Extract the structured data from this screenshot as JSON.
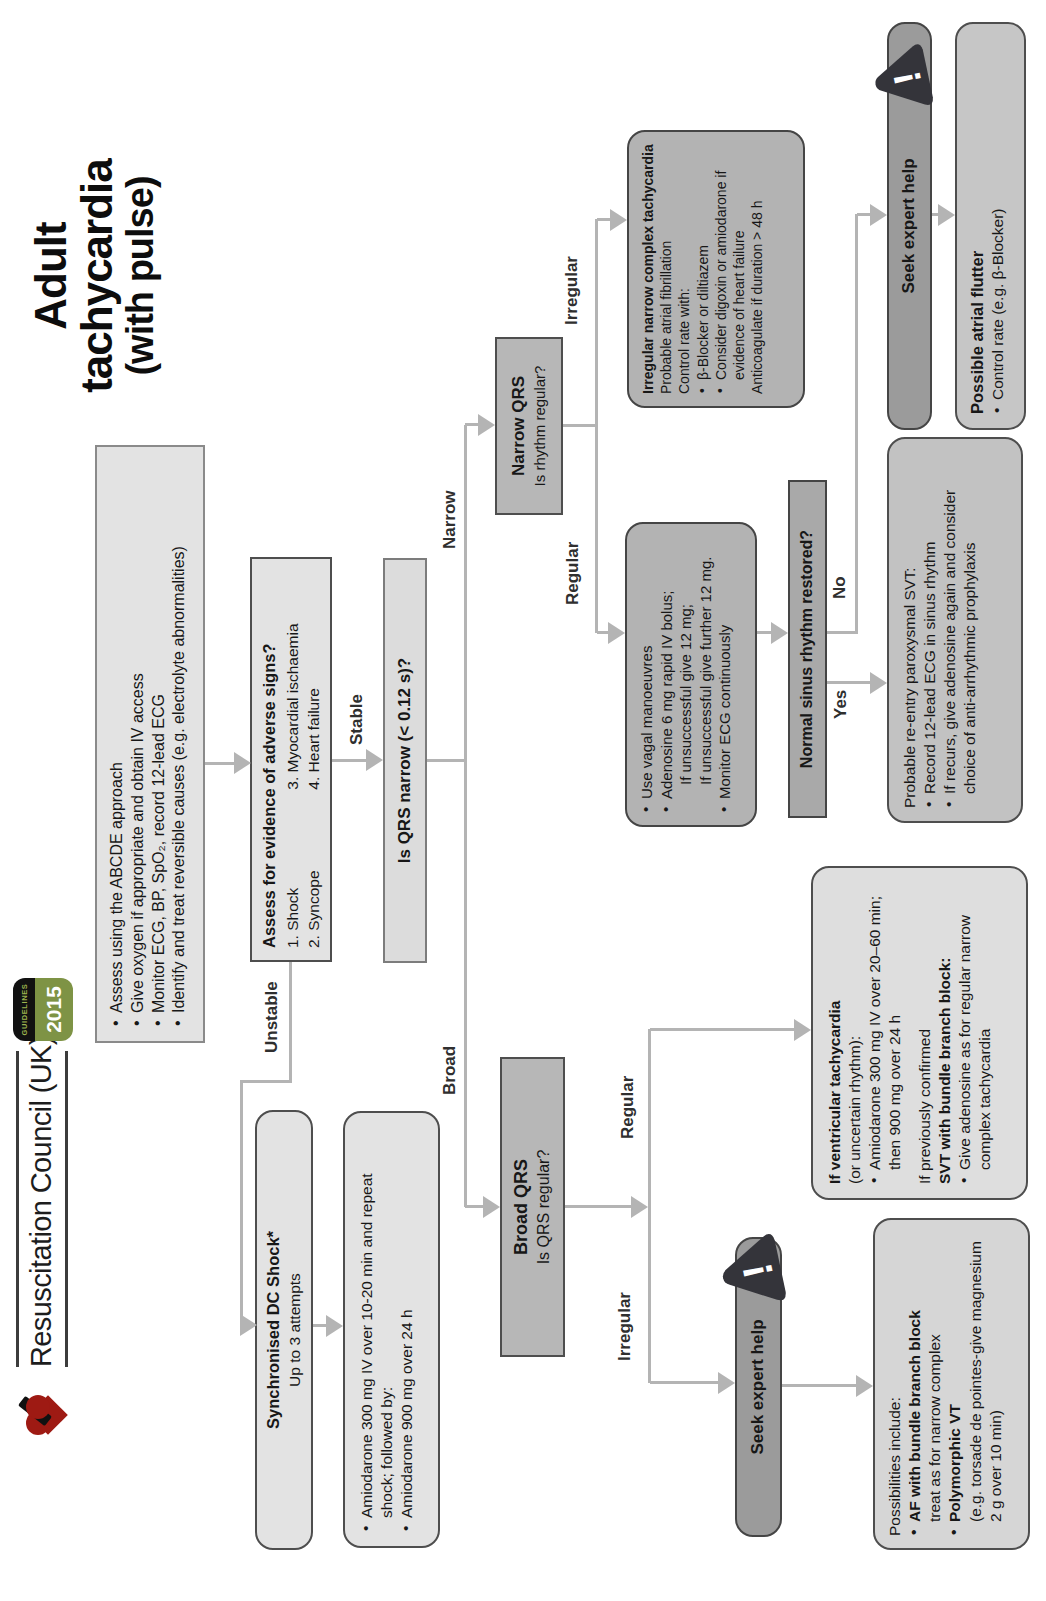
{
  "header": {
    "org_name": "Resuscitation Council (UK)",
    "badge_top": "GUIDELINES",
    "badge_year": "2015",
    "title_line1": "Adult tachycardia",
    "title_line2": "(with pulse)"
  },
  "colors": {
    "accent_green": "#7e9345",
    "heart_red": "#9e1a13",
    "box_light": "#e3e3e3",
    "box_mid": "#b7b7b7",
    "box_dark": "#9b9b9b",
    "connector_gray": "#b4b4b4",
    "warning_icon_dark": "#34343a"
  },
  "icons": {
    "warning": "!"
  },
  "labels": {
    "unstable": "Unstable",
    "stable": "Stable",
    "broad": "Broad",
    "narrow": "Narrow",
    "regular": "Regular",
    "irregular": "Irregular",
    "yes": "Yes",
    "no": "No"
  },
  "assess_box": {
    "items": [
      "Assess using the ABCDE approach",
      "Give oxygen if appropriate and obtain IV access",
      "Monitor ECG, BP, SpO₂, record 12-lead ECG",
      "Identify and treat reversible causes (e.g. electrolyte abnormalities)"
    ]
  },
  "adverse_box": {
    "title": "Assess for evidence of adverse signs?",
    "col1": [
      "1. Shock",
      "2. Syncope"
    ],
    "col2": [
      "3. Myocardial ischaemia",
      "4. Heart failure"
    ]
  },
  "dc_shock_box": {
    "title": "Synchronised DC Shock*",
    "subtitle": "Up to 3 attempts"
  },
  "amiodarone_box": {
    "items": [
      "Amiodarone 300 mg IV over 10-20 min and repeat shock; followed by:",
      "Amiodarone 900 mg over 24 h"
    ]
  },
  "qrs_width_box": {
    "question": "Is QRS narrow (< 0.12 s)?"
  },
  "broad_qrs_box": {
    "title": "Broad QRS",
    "question": "Is QRS regular?"
  },
  "narrow_qrs_box": {
    "title": "Narrow QRS",
    "question": "Is rhythm regular?"
  },
  "seek_expert": {
    "label": "Seek expert help"
  },
  "possibilities_box": {
    "intro": "Possibilities include:",
    "item1": "AF with bundle branch block",
    "item1_note": "treat as for narrow complex",
    "item2": "Polymorphic VT",
    "item2_note": "(e.g. torsade de pointes-give magnesium 2 g over 10 min)"
  },
  "vt_box": {
    "title": "If ventricular tachycardia",
    "subtitle": "(or uncertain rhythm):",
    "item1": "Amiodarone 300 mg IV over 20–60 min; then 900 mg over 24 h",
    "alt_intro": "If previously confirmed",
    "alt_title": "SVT with bundle branch block:",
    "item2": "Give adenosine as for regular narrow complex tachycardia"
  },
  "vagal_box": {
    "item1": "Use vagal manoeuvres",
    "item2": "Adenosine 6 mg rapid IV bolus;",
    "item2_sub1": "If unsuccessful give 12 mg;",
    "item2_sub2": "If unsuccessful give further 12 mg.",
    "item3": "Monitor ECG continuously"
  },
  "sinus_box": {
    "question": "Normal sinus rhythm restored?"
  },
  "svt_box": {
    "title": "Probable re-entry paroxysmal SVT:",
    "item1": "Record 12-lead ECG in sinus rhythm",
    "item2": "If recurs, give adenosine again and consider choice of anti-arrhythmic prophylaxis"
  },
  "irregular_box": {
    "title": "Irregular narrow complex tachycardia",
    "line1": "Probable atrial fibrillation",
    "line2": "Control rate with:",
    "item1": "β-Blocker or diltiazem",
    "item2": "Consider digoxin or amiodarone if evidence of heart failure",
    "line3": "Anticoagulate if duration > 48 h"
  },
  "flutter_box": {
    "title": "Possible atrial flutter",
    "item1": "Control rate (e.g. β-Blocker)"
  }
}
